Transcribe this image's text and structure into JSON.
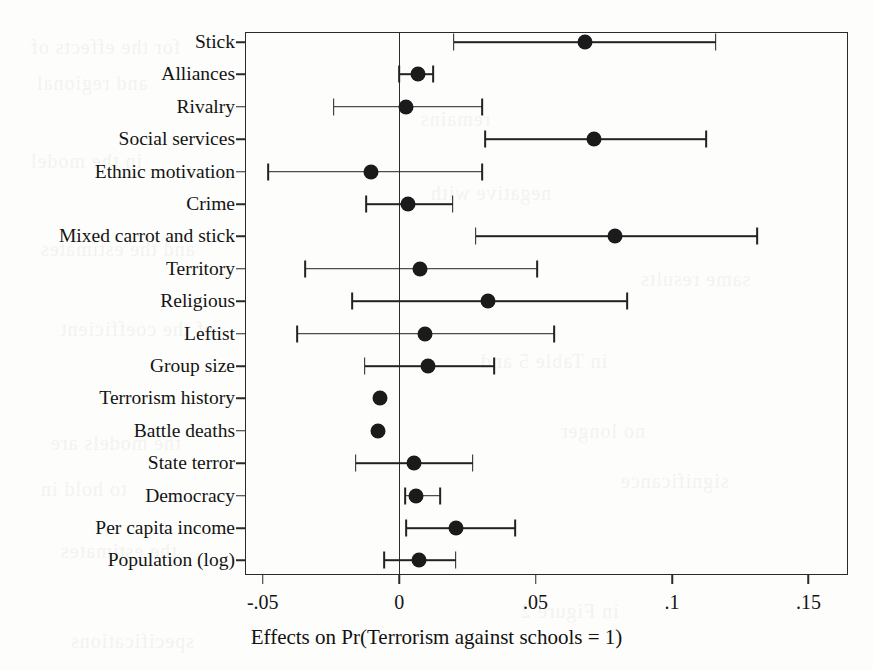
{
  "figure": {
    "axis_title": "Effects on Pr(Terrorism against schools = 1)",
    "ink_color": "#1b1b1b",
    "frame_color": "#2a2a2a",
    "background_color": "#fdfdfb"
  },
  "chart_data": {
    "type": "scatter",
    "subtype": "coefficient-plot",
    "title": "",
    "xlabel": "Effects on Pr(Terrorism against schools = 1)",
    "ylabel": "",
    "xlim": [
      -0.0565,
      0.1645
    ],
    "xticks": [
      -0.05,
      0,
      0.05,
      0.1,
      0.15
    ],
    "xticklabels": [
      "-.05",
      "0",
      ".05",
      ".1",
      ".15"
    ],
    "grid": false,
    "legend": false,
    "reference_line": 0,
    "categories": [
      "Stick",
      "Alliances",
      "Rivalry",
      "Social services",
      "Ethnic motivation",
      "Crime",
      "Mixed carrot and stick",
      "Territory",
      "Religious",
      "Leftist",
      "Group size",
      "Terrorism history",
      "Battle deaths",
      "State terror",
      "Democracy",
      "Per capita income",
      "Population (log)"
    ],
    "estimates": [
      0.068,
      0.007,
      0.0025,
      0.0715,
      -0.0102,
      0.0033,
      0.079,
      0.0076,
      0.0324,
      0.0095,
      0.0105,
      -0.0069,
      -0.0076,
      0.0055,
      0.0062,
      0.0207,
      0.0073
    ],
    "ci_low": [
      0.02,
      0.0,
      -0.024,
      0.0316,
      -0.048,
      -0.012,
      0.028,
      -0.0345,
      -0.0173,
      -0.0375,
      -0.0127,
      -0.0069,
      -0.0076,
      -0.016,
      0.0022,
      0.0025,
      -0.0055
    ],
    "ci_high": [
      0.116,
      0.0124,
      0.0305,
      0.1124,
      0.0305,
      0.0196,
      0.1313,
      0.0505,
      0.0835,
      0.0567,
      0.0349,
      -0.0069,
      -0.0076,
      0.0269,
      0.0149,
      0.0425,
      0.0207
    ],
    "points": [
      {
        "label": "Stick",
        "estimate": 0.068,
        "ci_low": 0.02,
        "ci_high": 0.116
      },
      {
        "label": "Alliances",
        "estimate": 0.007,
        "ci_low": 0.0,
        "ci_high": 0.0124
      },
      {
        "label": "Rivalry",
        "estimate": 0.0025,
        "ci_low": -0.024,
        "ci_high": 0.0305
      },
      {
        "label": "Social services",
        "estimate": 0.0715,
        "ci_low": 0.0316,
        "ci_high": 0.1124
      },
      {
        "label": "Ethnic motivation",
        "estimate": -0.0102,
        "ci_low": -0.048,
        "ci_high": 0.0305
      },
      {
        "label": "Crime",
        "estimate": 0.0033,
        "ci_low": -0.012,
        "ci_high": 0.0196
      },
      {
        "label": "Mixed carrot and stick",
        "estimate": 0.079,
        "ci_low": 0.028,
        "ci_high": 0.1313
      },
      {
        "label": "Territory",
        "estimate": 0.0076,
        "ci_low": -0.0345,
        "ci_high": 0.0505
      },
      {
        "label": "Religious",
        "estimate": 0.0324,
        "ci_low": -0.0173,
        "ci_high": 0.0835
      },
      {
        "label": "Leftist",
        "estimate": 0.0095,
        "ci_low": -0.0375,
        "ci_high": 0.0567
      },
      {
        "label": "Group size",
        "estimate": 0.0105,
        "ci_low": -0.0127,
        "ci_high": 0.0349
      },
      {
        "label": "Terrorism history",
        "estimate": -0.0069,
        "ci_low": -0.0069,
        "ci_high": -0.0069
      },
      {
        "label": "Battle deaths",
        "estimate": -0.0076,
        "ci_low": -0.0076,
        "ci_high": -0.0076
      },
      {
        "label": "State terror",
        "estimate": 0.0055,
        "ci_low": -0.016,
        "ci_high": 0.0269
      },
      {
        "label": "Democracy",
        "estimate": 0.0062,
        "ci_low": 0.0022,
        "ci_high": 0.0149
      },
      {
        "label": "Per capita income",
        "estimate": 0.0207,
        "ci_low": 0.0025,
        "ci_high": 0.0425
      },
      {
        "label": "Population (log)",
        "estimate": 0.0073,
        "ci_low": -0.0055,
        "ci_high": 0.0207
      }
    ]
  },
  "ghost_text": [
    {
      "text": "for the effects of",
      "x": 30,
      "y": 36
    },
    {
      "text": "and regional",
      "x": 36,
      "y": 72
    },
    {
      "text": "in the model",
      "x": 30,
      "y": 150
    },
    {
      "text": "remains",
      "x": 420,
      "y": 108
    },
    {
      "text": "negative with",
      "x": 430,
      "y": 182
    },
    {
      "text": "and the estimates",
      "x": 40,
      "y": 238
    },
    {
      "text": "same results",
      "x": 640,
      "y": 268
    },
    {
      "text": "of the coefficient",
      "x": 60,
      "y": 318
    },
    {
      "text": "in Table 5 and",
      "x": 480,
      "y": 350
    },
    {
      "text": "the models are",
      "x": 50,
      "y": 432
    },
    {
      "text": "no longer",
      "x": 560,
      "y": 420
    },
    {
      "text": "to hold in",
      "x": 40,
      "y": 478
    },
    {
      "text": "significance",
      "x": 620,
      "y": 470
    },
    {
      "text": "the estimates",
      "x": 60,
      "y": 540
    },
    {
      "text": "in Figure 2",
      "x": 520,
      "y": 600
    },
    {
      "text": "specifications",
      "x": 70,
      "y": 630
    }
  ]
}
